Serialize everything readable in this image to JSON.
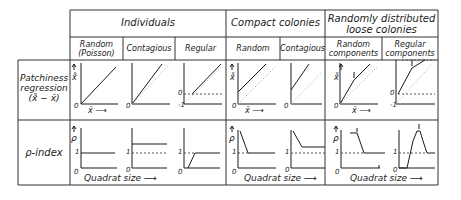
{
  "header": {
    "groups": [
      {
        "label": "Individuals"
      },
      {
        "label": "Compact colonies"
      },
      {
        "label_line1": "Randomly distributed",
        "label_line2": "loose colonies"
      }
    ],
    "subheaders": [
      {
        "line1": "Random",
        "line2": "(Poisson)"
      },
      {
        "line1": "Contagious"
      },
      {
        "line1": "Regular"
      },
      {
        "line1": "Random"
      },
      {
        "line1": "Contagious"
      },
      {
        "line1": "Random",
        "line2": "components"
      },
      {
        "line1": "Regular",
        "line2": "components"
      }
    ]
  },
  "rows": [
    {
      "line1": "Patchiness",
      "line2": "regression",
      "line3": "(x̊ − x̄)"
    },
    {
      "line1": "ρ-index"
    }
  ],
  "axis_labels": {
    "patchiness_y": "x̊",
    "patchiness_x": "x̄ ⟶",
    "rho_y": "ρ",
    "quadrat_size": "Quadrat size ⟶",
    "zero": "0",
    "one": "1",
    "minus_one": "-1"
  },
  "colors": {
    "line": "#1a1a1a",
    "grid": "#333333",
    "dotted": "#999999"
  }
}
